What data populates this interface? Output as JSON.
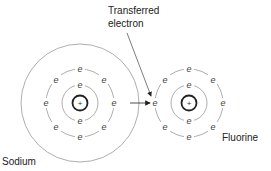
{
  "diagram": {
    "labels": {
      "transferred_line1": "Transferred",
      "transferred_line2": "electron",
      "sodium": "Sodium",
      "fluorine": "Fluorine"
    },
    "electron_symbol": "e",
    "nucleus_symbol": "+",
    "atoms": [
      {
        "name": "Sodium",
        "shells": [
          2,
          8,
          1
        ],
        "shown_electrons": 10,
        "note": "outer shell electron transferred"
      },
      {
        "name": "Fluorine",
        "shells": [
          2,
          7
        ],
        "receives": 1
      }
    ],
    "colors": {
      "line": "#888888",
      "nucleus": "#222222",
      "text": "#222222"
    }
  }
}
